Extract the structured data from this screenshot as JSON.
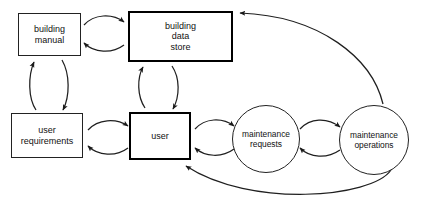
{
  "diagram": {
    "type": "flow-diagram",
    "background_color": "#ffffff",
    "line_color": "#222222",
    "text_color": "#111111",
    "nodes": [
      {
        "id": "building-manual",
        "shape": "rectangle",
        "label": "building\nmanual",
        "emphasis": "normal"
      },
      {
        "id": "building-data-store",
        "shape": "rectangle",
        "label": "building\ndata\nstore",
        "emphasis": "bold"
      },
      {
        "id": "user-requirements",
        "shape": "rectangle",
        "label": "user\nrequirements",
        "emphasis": "normal"
      },
      {
        "id": "user",
        "shape": "rectangle",
        "label": "user",
        "emphasis": "bold"
      },
      {
        "id": "maintenance-requests",
        "shape": "circle",
        "label": "maintenance\nrequests",
        "emphasis": "normal"
      },
      {
        "id": "maintenance-operations",
        "shape": "circle",
        "label": "maintenance\noperations",
        "emphasis": "normal"
      }
    ],
    "edges": [
      {
        "from": "building-manual",
        "to": "building-data-store",
        "style": "curved-arrow"
      },
      {
        "from": "building-data-store",
        "to": "building-manual",
        "style": "curved-arrow"
      },
      {
        "from": "user-requirements",
        "to": "building-manual",
        "style": "curved-arrow"
      },
      {
        "from": "building-manual",
        "to": "user-requirements",
        "style": "curved-arrow"
      },
      {
        "from": "user",
        "to": "building-data-store",
        "style": "curved-arrow"
      },
      {
        "from": "building-data-store",
        "to": "user",
        "style": "curved-arrow"
      },
      {
        "from": "user-requirements",
        "to": "user",
        "style": "curved-arrow"
      },
      {
        "from": "user",
        "to": "user-requirements",
        "style": "curved-arrow"
      },
      {
        "from": "user",
        "to": "maintenance-requests",
        "style": "curved-arrow"
      },
      {
        "from": "maintenance-requests",
        "to": "user",
        "style": "curved-arrow"
      },
      {
        "from": "maintenance-requests",
        "to": "maintenance-operations",
        "style": "curved-arrow"
      },
      {
        "from": "maintenance-operations",
        "to": "maintenance-requests",
        "style": "curved-arrow"
      },
      {
        "from": "maintenance-operations",
        "to": "building-data-store",
        "style": "long-curved-arrow"
      },
      {
        "from": "maintenance-operations",
        "to": "user",
        "style": "long-curved-arrow"
      }
    ]
  }
}
